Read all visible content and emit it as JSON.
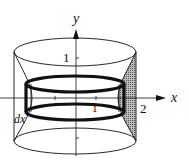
{
  "diagram": {
    "type": "shell-method-solid-of-revolution",
    "axes": {
      "x_label": "x",
      "y_label": "y"
    },
    "tick_labels": {
      "y_one": "1",
      "x_one": "1",
      "x_two": "2"
    },
    "annotations": {
      "shell_thickness": "dx"
    },
    "colors": {
      "stroke": "#111111",
      "shade": "#8a8a8a",
      "background": "#ffffff"
    }
  }
}
